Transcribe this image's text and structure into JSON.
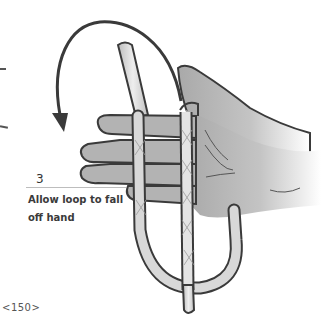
{
  "step": {
    "number": "3",
    "caption_line1": "Allow loop to fall",
    "caption_line2": "off hand"
  },
  "page": {
    "number": "<150>"
  },
  "illustration": {
    "subject": "hand with rope loop and curved arrow",
    "arrow_direction": "counter-clockwise-down",
    "colors": {
      "outline": "#3a3a3a",
      "hand_fill": "#b8b8b8",
      "rope_fill": "#d6d6d6",
      "arrow": "#3a3a3a"
    }
  }
}
